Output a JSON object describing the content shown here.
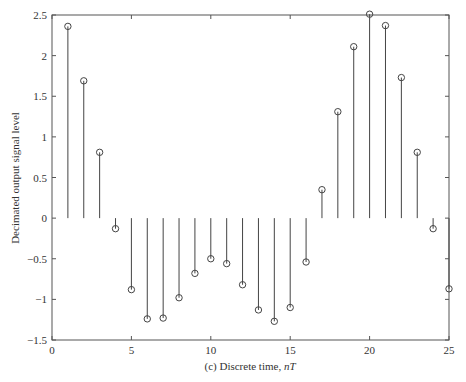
{
  "chart_data": {
    "type": "stem",
    "title": "",
    "xlabel_prefix": "(c) Discrete time, ",
    "xlabel_italic": "nT",
    "ylabel": "Decimated output signal level",
    "xlim": [
      0,
      25
    ],
    "ylim": [
      -1.5,
      2.5
    ],
    "xticks": [
      0,
      5,
      10,
      15,
      20,
      25
    ],
    "xtick_labels": [
      "0",
      "5",
      "10",
      "15",
      "20",
      "25"
    ],
    "yticks": [
      -1.5,
      -1,
      -0.5,
      0,
      0.5,
      1,
      1.5,
      2,
      2.5
    ],
    "ytick_labels": [
      "−1.5",
      "−1",
      "−0.5",
      "0",
      "0.5",
      "1",
      "1.5",
      "2",
      "2.5"
    ],
    "grid": false,
    "box": true,
    "marker": "circle-open",
    "color": "#444444",
    "x": [
      1,
      2,
      3,
      4,
      5,
      6,
      7,
      8,
      9,
      10,
      11,
      12,
      13,
      14,
      15,
      16,
      17,
      18,
      19,
      20,
      21,
      22,
      23,
      24,
      25
    ],
    "values": [
      2.36,
      1.69,
      0.81,
      -0.13,
      -0.88,
      -1.24,
      -1.23,
      -0.98,
      -0.68,
      -0.5,
      -0.56,
      -0.82,
      -1.13,
      -1.27,
      -1.1,
      -0.54,
      0.35,
      1.31,
      2.11,
      2.51,
      2.37,
      1.73,
      0.81,
      -0.13,
      -0.87
    ]
  }
}
